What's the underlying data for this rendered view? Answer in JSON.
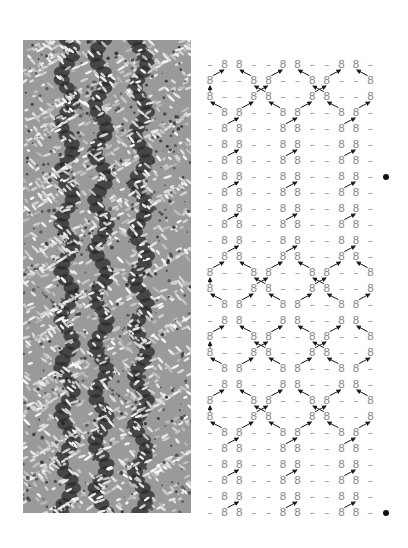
{
  "figure": {
    "photo": {
      "label": "knitted-cable-swatch-photo",
      "description": "Grayscale photo of a knitted cable/lattice swatch"
    },
    "chart": {
      "symbols": {
        "knit_twisted": "8",
        "purl": "–"
      },
      "row_types": {
        "A": [
          "–",
          "8",
          "8",
          "–",
          "–",
          "8",
          "8",
          "–",
          "–",
          "8",
          "8",
          "–"
        ],
        "B": [
          "8",
          "–",
          "–",
          "8",
          "8",
          "–",
          "–",
          "8",
          "8",
          "–",
          "–",
          "8"
        ]
      },
      "rows": [
        "A",
        "B",
        "B",
        "A",
        "A",
        "A",
        "A",
        "A",
        "A",
        "A",
        "A",
        "A",
        "A",
        "B",
        "B",
        "A",
        "A",
        "B",
        "B",
        "A",
        "A",
        "B",
        "B",
        "A",
        "A",
        "A",
        "A",
        "A",
        "A"
      ],
      "bullet_rows": [
        8,
        29
      ],
      "colors": {
        "symbol": "#8c8c8c",
        "arrow": "#1a1a1a",
        "bullet": "#111111"
      }
    }
  }
}
